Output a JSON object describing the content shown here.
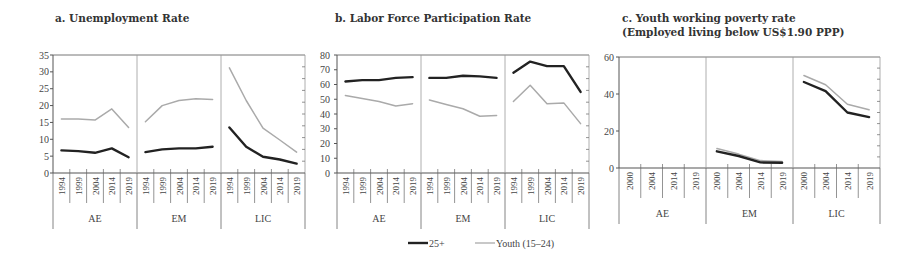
{
  "colors": {
    "adult": "#222222",
    "youth": "#aaaaaa",
    "axis": "#555555",
    "divider": "#999999"
  },
  "legend": [
    {
      "key": "adult",
      "label": "25+"
    },
    {
      "key": "youth",
      "label": "Youth (15–24)"
    }
  ],
  "chart_data": [
    {
      "type": "line",
      "title": "a. Unemployment Rate",
      "groups": [
        "AE",
        "EM",
        "LIC"
      ],
      "x": [
        "1994",
        "1999",
        "2004",
        "2014",
        "2019"
      ],
      "ylim": [
        0,
        35
      ],
      "yticks": [
        0,
        5,
        10,
        15,
        20,
        25,
        30,
        35
      ],
      "series": [
        {
          "name": "25+",
          "values": {
            "AE": [
              6.7,
              6.5,
              6.0,
              7.3,
              4.7
            ],
            "EM": [
              6.2,
              7.0,
              7.3,
              7.3,
              7.8
            ],
            "LIC": [
              13.5,
              7.8,
              4.8,
              4.0,
              2.8
            ]
          }
        },
        {
          "name": "Youth (15–24)",
          "values": {
            "AE": [
              16.0,
              16.0,
              15.7,
              19.0,
              13.5
            ],
            "EM": [
              15.2,
              20.0,
              21.5,
              22.0,
              21.8
            ],
            "LIC": [
              31.2,
              21.5,
              13.3,
              9.8,
              6.2
            ]
          }
        }
      ]
    },
    {
      "type": "line",
      "title": "b. Labor Force Participation Rate",
      "groups": [
        "AE",
        "EM",
        "LIC"
      ],
      "x": [
        "1994",
        "1999",
        "2004",
        "2014",
        "2019"
      ],
      "ylim": [
        0,
        80
      ],
      "yticks": [
        0,
        10,
        20,
        30,
        40,
        50,
        60,
        70,
        80
      ],
      "series": [
        {
          "name": "25+",
          "values": {
            "AE": [
              62,
              63,
              63,
              64.5,
              65
            ],
            "EM": [
              64.5,
              64.5,
              66,
              65.5,
              64.5
            ],
            "LIC": [
              68,
              75.5,
              72.5,
              72.5,
              55
            ]
          }
        },
        {
          "name": "Youth (15–24)",
          "values": {
            "AE": [
              52.5,
              50.5,
              48.5,
              45.5,
              47
            ],
            "EM": [
              49.5,
              46.5,
              43.5,
              38.5,
              39
            ],
            "LIC": [
              48.5,
              59.5,
              47,
              47.5,
              33.5
            ]
          }
        }
      ]
    },
    {
      "type": "line",
      "title": "c. Youth working poverty rate",
      "subtitle": "(Employed living below US$1.90 PPP)",
      "groups": [
        "AE",
        "EM",
        "LIC"
      ],
      "x": [
        "2000",
        "2004",
        "2014",
        "2019"
      ],
      "ylim": [
        0,
        60
      ],
      "yticks": [
        0,
        20,
        40,
        60
      ],
      "series": [
        {
          "name": "25+",
          "values": {
            "AE": [],
            "EM": [
              9,
              6.5,
              3,
              2.8
            ],
            "LIC": [
              46.5,
              41.5,
              30,
              27.5
            ]
          }
        },
        {
          "name": "Youth (15–24)",
          "values": {
            "AE": [],
            "EM": [
              10.5,
              7.5,
              4,
              3.5
            ],
            "LIC": [
              50,
              45,
              34.5,
              31.5
            ]
          }
        }
      ]
    }
  ]
}
